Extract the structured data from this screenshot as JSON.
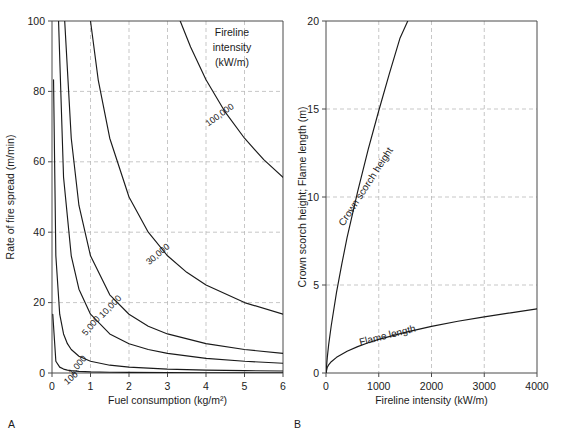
{
  "figure": {
    "panels": [
      {
        "letter": "A",
        "annotation_lines": [
          "Fireline",
          "intensity",
          "(kW/m)"
        ]
      },
      {
        "letter": "B",
        "annotation_lines": []
      }
    ]
  },
  "chart_data": [
    {
      "type": "line",
      "panel": "A",
      "title": "",
      "xlabel": "Fuel consumption (kg/m²)",
      "ylabel": "Rate of fire spread (m/min)",
      "xlim": [
        0,
        6
      ],
      "ylim": [
        0,
        100
      ],
      "xticks": [
        0,
        1,
        2,
        3,
        4,
        5,
        6
      ],
      "yticks": [
        0,
        20,
        40,
        60,
        80,
        100
      ],
      "xticklabels": [
        "0",
        "1",
        "2",
        "3",
        "4",
        "5",
        "6"
      ],
      "yticklabels": [
        "0",
        "20",
        "40",
        "60",
        "80",
        "100"
      ],
      "grid": true,
      "legend": "none",
      "annotation": "Fireline intensity (kW/m)",
      "relation": "intensity = heat_yield * fuel_consumption * rate_of_spread / 60, heat_yield = 18000 kJ/kg",
      "heat_yield": 18000,
      "series": [
        {
          "name": "100",
          "label": "100",
          "intensity": 100,
          "x": [
            0.02,
            0.1,
            0.2,
            0.3,
            0.4,
            0.5,
            0.7,
            1.0,
            1.5,
            2.0,
            3.0,
            4.0,
            5.0,
            6.0
          ],
          "y": [
            16.67,
            3.33,
            1.67,
            1.11,
            0.83,
            0.67,
            0.48,
            0.33,
            0.22,
            0.17,
            0.11,
            0.08,
            0.07,
            0.06
          ]
        },
        {
          "name": "1,000",
          "label": "1,000",
          "intensity": 1000,
          "x": [
            0.04,
            0.1,
            0.2,
            0.3,
            0.4,
            0.5,
            0.7,
            1.0,
            1.5,
            2.0,
            3.0,
            4.0,
            5.0,
            6.0
          ],
          "y": [
            83.3,
            33.3,
            16.7,
            11.1,
            8.33,
            6.67,
            4.76,
            3.33,
            2.22,
            1.67,
            1.11,
            0.83,
            0.67,
            0.56
          ]
        },
        {
          "name": "5,000",
          "label": "5,000",
          "intensity": 5000,
          "x": [
            0.17,
            0.3,
            0.5,
            0.7,
            1.0,
            1.5,
            2.0,
            2.5,
            3.0,
            4.0,
            5.0,
            6.0
          ],
          "y": [
            100.0,
            55.6,
            33.3,
            23.8,
            16.7,
            11.1,
            8.33,
            6.67,
            5.56,
            4.17,
            3.33,
            2.78
          ]
        },
        {
          "name": "10,000",
          "label": "10,000",
          "intensity": 10000,
          "x": [
            0.33,
            0.5,
            0.7,
            1.0,
            1.5,
            2.0,
            2.5,
            3.0,
            4.0,
            5.0,
            6.0
          ],
          "y": [
            100.0,
            66.7,
            47.6,
            33.3,
            22.2,
            16.7,
            13.3,
            11.1,
            8.33,
            6.67,
            5.56
          ]
        },
        {
          "name": "30,000",
          "label": "30,000",
          "intensity": 30000,
          "x": [
            1.0,
            1.2,
            1.5,
            2.0,
            2.5,
            3.0,
            3.5,
            4.0,
            5.0,
            6.0
          ],
          "y": [
            100.0,
            83.3,
            66.7,
            50.0,
            40.0,
            33.3,
            28.6,
            25.0,
            20.0,
            16.7
          ]
        },
        {
          "name": "100,000",
          "label": "100,000",
          "intensity": 100000,
          "x": [
            3.33,
            3.6,
            4.0,
            4.5,
            5.0,
            5.5,
            6.0
          ],
          "y": [
            100.0,
            92.6,
            83.3,
            74.1,
            66.7,
            60.6,
            55.6
          ]
        }
      ]
    },
    {
      "type": "line",
      "panel": "B",
      "title": "",
      "xlabel": "Fireline intensity (kW/m)",
      "ylabel": "Crown scorch height; Flame length (m)",
      "xlim": [
        0,
        4000
      ],
      "ylim": [
        0,
        20
      ],
      "xticks": [
        0,
        1000,
        2000,
        3000,
        4000
      ],
      "yticks": [
        0,
        5,
        10,
        15,
        20
      ],
      "xticklabels": [
        "0",
        "1000",
        "2000",
        "3000",
        "4000"
      ],
      "yticklabels": [
        "0",
        "5",
        "10",
        "15",
        "20"
      ],
      "grid": true,
      "legend": "inline-labels",
      "series": [
        {
          "name": "crown-scorch-height",
          "label": "Crown scorch height",
          "x": [
            0,
            25,
            50,
            100,
            200,
            300,
            400,
            600,
            800,
            1000,
            1200,
            1400,
            1550
          ],
          "y": [
            0,
            0.9,
            1.6,
            2.7,
            4.6,
            6.2,
            7.7,
            10.3,
            12.7,
            14.9,
            17.0,
            19.0,
            20.0
          ]
        },
        {
          "name": "flame-length",
          "label": "Flame length",
          "x": [
            0,
            25,
            50,
            100,
            200,
            400,
            600,
            800,
            1000,
            1500,
            2000,
            2500,
            3000,
            3500,
            4000
          ],
          "y": [
            0,
            0.33,
            0.46,
            0.64,
            0.89,
            1.24,
            1.5,
            1.72,
            1.91,
            2.31,
            2.65,
            2.94,
            3.19,
            3.42,
            3.64
          ]
        }
      ]
    }
  ]
}
